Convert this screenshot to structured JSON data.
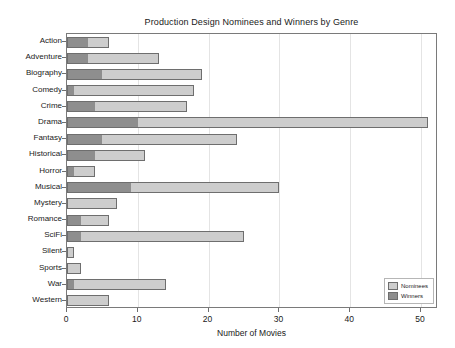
{
  "chart_data": {
    "type": "bar",
    "orientation": "horizontal",
    "stacked": true,
    "title": "Production Design Nominees and Winners by Genre",
    "xlabel": "Number of Movies",
    "ylabel": "",
    "xlim": [
      0,
      52.4
    ],
    "xticks": [
      0,
      10,
      20,
      30,
      40,
      50
    ],
    "grid": "vertical",
    "legend_position": "lower right",
    "categories": [
      "Action",
      "Adventure",
      "Biography",
      "Comedy",
      "Crime",
      "Drama",
      "Fantasy",
      "Historical",
      "Horror",
      "Musical",
      "Mystery",
      "Romance",
      "SciFi",
      "Silent",
      "Sports",
      "War",
      "Western"
    ],
    "series": [
      {
        "name": "Winners",
        "color": "#8e8e8e",
        "values": [
          3,
          3,
          5,
          1,
          4,
          10,
          5,
          4,
          1,
          9,
          0,
          2,
          2,
          0,
          0,
          1,
          0
        ]
      },
      {
        "name": "Nominees",
        "color": "#cdcdcd",
        "values": [
          3,
          10,
          14,
          17,
          13,
          41,
          19,
          7,
          3,
          21,
          7,
          4,
          23,
          1,
          2,
          13,
          6
        ]
      }
    ],
    "totals": [
      6,
      13,
      19,
      18,
      17,
      51,
      24,
      11,
      4,
      30,
      7,
      6,
      25,
      1,
      2,
      14,
      6
    ],
    "bar_edge_color": "#6e6e6e",
    "grid_color": "#e4e4e4",
    "frame_color": "#7a7a7a"
  },
  "legend": {
    "items": [
      {
        "label": "Nominees",
        "color": "#cdcdcd"
      },
      {
        "label": "Winners",
        "color": "#8e8e8e"
      }
    ]
  }
}
